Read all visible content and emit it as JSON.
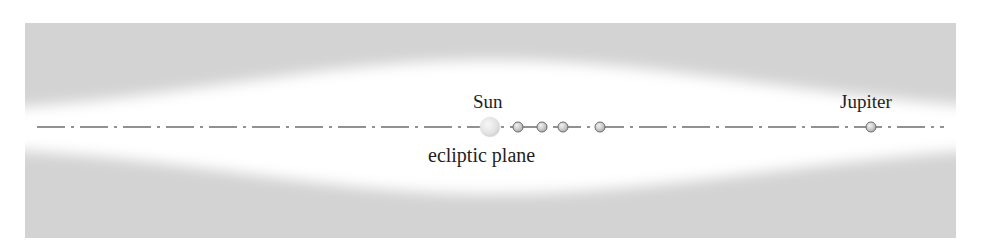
{
  "diagram": {
    "type": "solar-system-ecliptic-plane",
    "labels": {
      "sun": "Sun",
      "jupiter": "Jupiter",
      "ecliptic": "ecliptic plane"
    },
    "colors": {
      "background": "#ffffff",
      "band_gray": "#d3d3d3",
      "line": "#6d6d6d",
      "planet_fill": "#c8c8c8",
      "planet_stroke": "#6a6a6a",
      "sun_fill": "#e4e4e4",
      "text": "#231f20"
    },
    "bodies": [
      {
        "name": "Sun",
        "x": 490,
        "y": 127,
        "r": 10
      },
      {
        "name": "Mercury",
        "x": 518,
        "y": 127,
        "r": 5
      },
      {
        "name": "Venus",
        "x": 542,
        "y": 127,
        "r": 5
      },
      {
        "name": "Earth",
        "x": 563,
        "y": 127,
        "r": 5
      },
      {
        "name": "Mars",
        "x": 600,
        "y": 127,
        "r": 5
      },
      {
        "name": "Jupiter",
        "x": 871,
        "y": 127,
        "r": 5
      }
    ]
  }
}
